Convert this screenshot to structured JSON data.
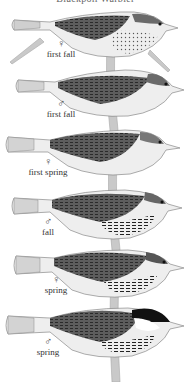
{
  "title": "Blackpoll Warbler",
  "plates": [
    {
      "sex_symbol": "♀",
      "sex": "female",
      "label": "first fall",
      "label_x": 60,
      "label_y": 40
    },
    {
      "sex_symbol": "♂",
      "sex": "male",
      "label": "first fall",
      "label_x": 59,
      "label_y": 100
    },
    {
      "sex_symbol": "♀",
      "sex": "female",
      "label": "first spring",
      "label_x": 42,
      "label_y": 157
    },
    {
      "sex_symbol": "♂",
      "sex": "male",
      "label": "fall",
      "label_x": 47,
      "label_y": 217
    },
    {
      "sex_symbol": "♀",
      "sex": "female",
      "label": "spring",
      "label_x": 55,
      "label_y": 276
    },
    {
      "sex_symbol": "♂",
      "sex": "male",
      "label": "spring",
      "label_x": 47,
      "label_y": 337
    }
  ],
  "colors": {
    "background": "#ffffff",
    "bird_dark": "#3a3a3a",
    "bird_mid": "#8a8a8a",
    "bird_light": "#e6e6e6",
    "perch": "#bdbdbd"
  }
}
